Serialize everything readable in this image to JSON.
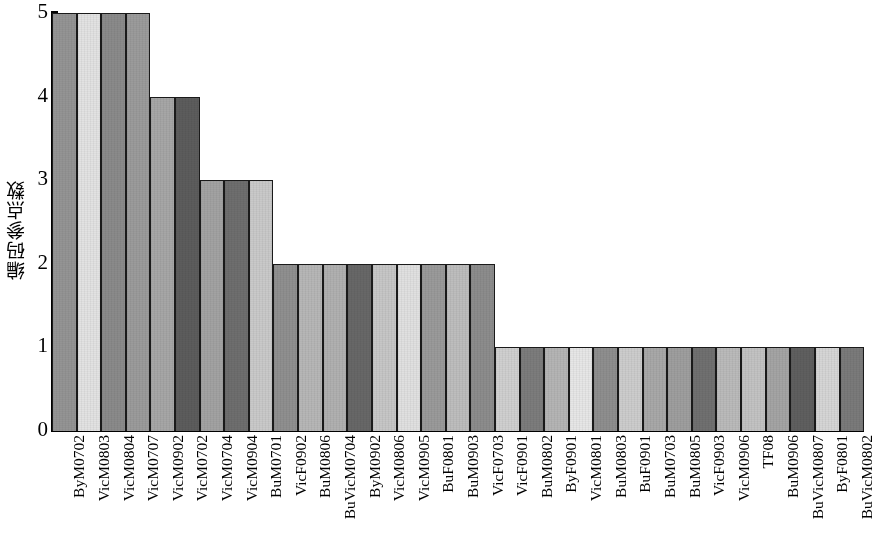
{
  "chart_data": {
    "type": "bar",
    "title": "",
    "xlabel": "",
    "ylabel": "编码参点数",
    "ylim": [
      0,
      5
    ],
    "yticks": [
      "0",
      "1",
      "2",
      "3",
      "4",
      "5"
    ],
    "grid": false,
    "legend": "none",
    "categories": [
      "ByM0702",
      "VicM0803",
      "VicM0804",
      "VicM0707",
      "VicM0902",
      "VicM0702",
      "VicM0704",
      "VicM0904",
      "BuM0701",
      "VicF0902",
      "BuM0806",
      "BuVicM0704",
      "ByM0902",
      "VicM0806",
      "VicM0905",
      "BuF0801",
      "BuM0903",
      "VicF0703",
      "VicF0901",
      "BuM0802",
      "ByF0901",
      "VicM0801",
      "BuM0803",
      "BuF0901",
      "BuM0703",
      "BuM0805",
      "VicF0903",
      "VicM0906",
      "TF08",
      "BuM0906",
      "BuVicM0807",
      "ByF0801",
      "BuVicM0802"
    ],
    "values": [
      5,
      5,
      5,
      5,
      4,
      4,
      3,
      3,
      3,
      2,
      2,
      2,
      2,
      2,
      2,
      2,
      2,
      2,
      1,
      1,
      1,
      1,
      1,
      1,
      1,
      1,
      1,
      1,
      1,
      1,
      1,
      1,
      1
    ],
    "bar_shades": [
      "#949494",
      "#e2e2e2",
      "#8a8a8a",
      "#9b9b9b",
      "#a6a6a6",
      "#5c5c5c",
      "#a2a2a2",
      "#6e6e6e",
      "#c9c9c9",
      "#8f8f8f",
      "#b6b6b6",
      "#b0b0b0",
      "#676767",
      "#c6c6c6",
      "#e0e0e0",
      "#9a9a9a",
      "#bdbdbd",
      "#8c8c8c",
      "#cfcfcf",
      "#7c7c7c",
      "#b4b4b4",
      "#e6e6e6",
      "#8e8e8e",
      "#cccccc",
      "#a8a8a8",
      "#9e9e9e",
      "#707070",
      "#bababa",
      "#c2c2c2",
      "#a4a4a4",
      "#5f5f5f",
      "#d5d5d5",
      "#7a7a7a"
    ]
  }
}
